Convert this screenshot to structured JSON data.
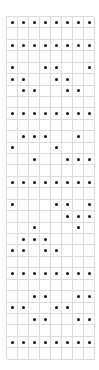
{
  "grid": {
    "columns": 8,
    "rows": 30,
    "line_color": "#dcdcdc",
    "dot_color": "#111111",
    "filled": [
      [
        0,
        1,
        2,
        3,
        4,
        5,
        6,
        7
      ],
      [],
      [
        0,
        1,
        2,
        3,
        4,
        5,
        6,
        7
      ],
      [],
      [
        0,
        3,
        4,
        7
      ],
      [
        0,
        1,
        4,
        5
      ],
      [
        1,
        2,
        5,
        6
      ],
      [],
      [
        0,
        1,
        2,
        3,
        4,
        5,
        6,
        7
      ],
      [],
      [
        1,
        2,
        3,
        6
      ],
      [
        0,
        4
      ],
      [
        2,
        5,
        6,
        7
      ],
      [],
      [
        0,
        1,
        2,
        3,
        4,
        5,
        6,
        7
      ],
      [],
      [
        0,
        4,
        5,
        7
      ],
      [
        5,
        6,
        7
      ],
      [
        2,
        6
      ],
      [
        1,
        2,
        3
      ],
      [
        0,
        1,
        3,
        4
      ],
      [],
      [
        0,
        1,
        2,
        3,
        4,
        5,
        6,
        7
      ],
      [],
      [
        2,
        3,
        6,
        7
      ],
      [
        0,
        1,
        4,
        5
      ],
      [
        2,
        3,
        6,
        7
      ],
      [],
      [
        0,
        1,
        2,
        3,
        4,
        5,
        6,
        7
      ],
      []
    ]
  }
}
